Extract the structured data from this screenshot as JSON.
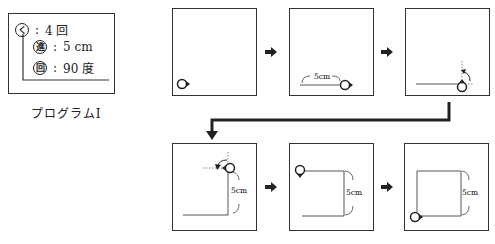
{
  "program": {
    "title": "プログラムⅠ",
    "commands": [
      {
        "icon": "く",
        "icon_name": "repeat",
        "value": "4 回"
      },
      {
        "icon": "進",
        "icon_name": "advance",
        "value": "5 cm"
      },
      {
        "icon": "回",
        "icon_name": "rotate",
        "value": "90 度"
      }
    ],
    "separator": ":"
  },
  "steps": [
    {
      "index": 1,
      "label": ""
    },
    {
      "index": 2,
      "label": "5cm"
    },
    {
      "index": 3,
      "label": ""
    },
    {
      "index": 4,
      "label": "5cm"
    },
    {
      "index": 5,
      "label": "5cm"
    },
    {
      "index": 6,
      "label": "5cm"
    }
  ],
  "colors": {
    "line": "#333333",
    "background": "#ffffff"
  }
}
